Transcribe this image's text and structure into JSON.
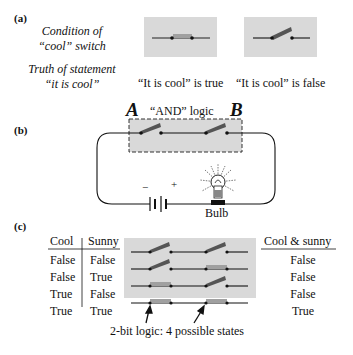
{
  "panel_a": {
    "label": "(a)",
    "row1_label_line1": "Condition of",
    "row1_label_line2": "“cool” switch",
    "row2_label_line1": "Truth of statement",
    "row2_label_line2": "“it is cool”",
    "closed_caption": "“It is cool” is true",
    "open_caption": "“It is cool” is false"
  },
  "panel_b": {
    "label": "(b)",
    "switch_a_label": "A",
    "switch_b_label": "B",
    "logic_label": "“AND” logic",
    "battery_minus": "−",
    "battery_plus": "+",
    "bulb_label": "Bulb"
  },
  "panel_c": {
    "label": "(c)",
    "headers": [
      "Cool",
      "Sunny"
    ],
    "result_header": "Cool & sunny",
    "rows": [
      {
        "cool": "False",
        "sunny": "False",
        "result": "False"
      },
      {
        "cool": "False",
        "sunny": "True",
        "result": "False"
      },
      {
        "cool": "True",
        "sunny": "False",
        "result": "False"
      },
      {
        "cool": "True",
        "sunny": "True",
        "result": "True"
      }
    ],
    "caption": "2-bit logic: 4 possible states"
  },
  "colors": {
    "panel_gray": "#d9d9d9",
    "switch_closed": "#a0a0a0",
    "switch_open": "#555555",
    "wire": "#111111"
  }
}
